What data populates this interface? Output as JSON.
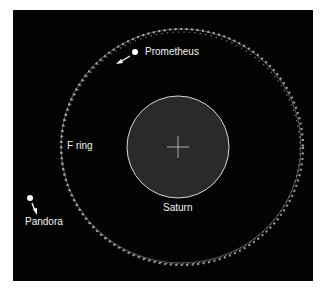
{
  "figure": {
    "background": "#030303",
    "labels": {
      "prometheus": "Prometheus",
      "pandora": "Pandora",
      "f_ring": "F ring",
      "saturn": "Saturn"
    },
    "colors": {
      "saturn_fill": "#2a2a2a",
      "saturn_outline": "#d8d8d8",
      "ring": "#bdbdbd",
      "moon": "#ffffff",
      "text": "#f2f2f2"
    }
  }
}
